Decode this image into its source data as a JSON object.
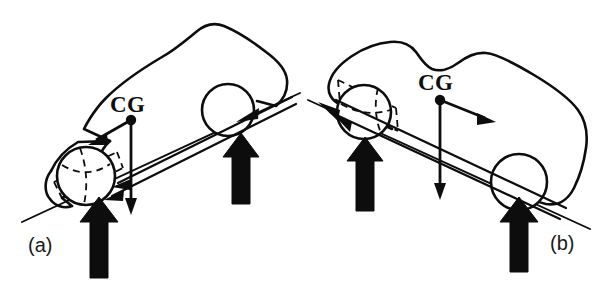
{
  "figure": {
    "stroke_color": "#0d0d0d",
    "background_color": "#ffffff",
    "panels": [
      {
        "id": "a",
        "label": "(a)",
        "label_x": 28,
        "label_y": 252,
        "condition": "uphill grade, vehicle nose down-slope to the left",
        "cg": {
          "label": "CG",
          "label_x": 112,
          "label_y": 112,
          "dot_x": 131,
          "dot_y": 120,
          "dot_radius": 5.2
        },
        "vectors": [
          {
            "name": "inertia-force-vector",
            "label": "",
            "from_x": 131,
            "from_y": 120,
            "to_x": 92,
            "to_y": 143,
            "head": "arrow"
          },
          {
            "name": "weight-vector",
            "label": "",
            "from_x": 131,
            "from_y": 120,
            "to_x": 131,
            "to_y": 212,
            "head": "arrow"
          }
        ],
        "wheels": [
          {
            "name": "front-wheel",
            "cx": 86,
            "cy": 176,
            "r": 29,
            "dashed_well": true
          },
          {
            "name": "rear-wheel",
            "cx": 228,
            "cy": 110,
            "r": 26,
            "dashed_well": false
          }
        ],
        "normal_arrows": [
          {
            "name": "front-normal-force-arrow",
            "x": 99,
            "y_base": 275,
            "y_tip": 199,
            "width": 26
          },
          {
            "name": "rear-normal-force-arrow",
            "x": 241,
            "y_base": 202,
            "y_tip": 134,
            "width": 24
          }
        ],
        "ground": {
          "x1": 22,
          "y1": 222,
          "x2": 300,
          "y2": 93
        },
        "traction": {
          "x1": 108,
          "y1": 197,
          "x2": 296,
          "y2": 104
        }
      },
      {
        "id": "b",
        "label": "(b)",
        "label_x": 552,
        "label_y": 250,
        "condition": "downhill grade, vehicle nose up-slope to the left",
        "cg": {
          "label": "CG",
          "label_x": 420,
          "label_y": 90,
          "dot_x": 440,
          "dot_y": 100,
          "dot_radius": 5.2
        },
        "vectors": [
          {
            "name": "inertia-force-vector",
            "label": "",
            "from_x": 440,
            "from_y": 100,
            "to_x": 488,
            "to_y": 120,
            "head": "arrow"
          },
          {
            "name": "weight-vector",
            "label": "",
            "from_x": 440,
            "from_y": 100,
            "to_x": 440,
            "to_y": 196,
            "head": "arrow"
          }
        ],
        "wheels": [
          {
            "name": "front-wheel",
            "cx": 364,
            "cy": 112,
            "r": 27,
            "dashed_well": true
          },
          {
            "name": "rear-wheel",
            "cx": 519,
            "cy": 182,
            "r": 28,
            "dashed_well": false
          }
        ],
        "normal_arrows": [
          {
            "name": "front-normal-force-arrow",
            "x": 365,
            "y_base": 210,
            "y_tip": 138,
            "width": 24
          },
          {
            "name": "rear-normal-force-arrow",
            "x": 519,
            "y_base": 268,
            "y_tip": 198,
            "width": 25
          }
        ],
        "ground": {
          "x1": 308,
          "y1": 100,
          "x2": 588,
          "y2": 228
        },
        "traction": {
          "x1": 330,
          "y1": 98,
          "x2": 562,
          "y2": 206
        }
      }
    ]
  }
}
